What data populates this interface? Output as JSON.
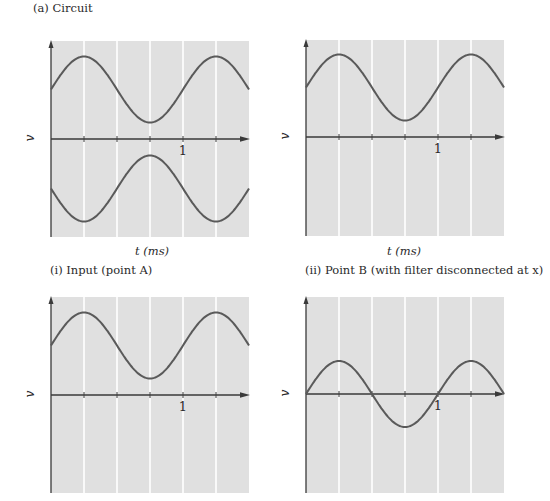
{
  "figure": {
    "title": "(a) Circuit",
    "colors": {
      "plot_bg": "#e0e0e0",
      "grid": "#ffffff",
      "axis": "#3a3a3a",
      "curve": "#5a5a5a"
    }
  },
  "panels": [
    {
      "id": "top-left",
      "caption": "",
      "xlabel": "t (ms)",
      "ylabel": "v"
    },
    {
      "id": "top-right",
      "caption": "",
      "xlabel": "t (ms)",
      "ylabel": "v"
    },
    {
      "id": "bottom-left",
      "caption": "(i) Input (point A)",
      "xlabel": "",
      "ylabel": "v"
    },
    {
      "id": "bottom-right",
      "caption": "(ii) Point B (with filter disconnected at x)",
      "xlabel": "",
      "ylabel": "v"
    }
  ],
  "chart_data": [
    {
      "type": "line",
      "title": "",
      "xlabel": "t (ms)",
      "ylabel": "v",
      "xlim": [
        0,
        1.5
      ],
      "xticks": [
        0.25,
        0.5,
        0.75,
        1.0,
        1.25
      ],
      "xtick_labels": {
        "1.0": "1"
      },
      "grid": "vertical",
      "series": [
        {
          "name": "upper (offset sinusoid)",
          "shape": "dc_offset + A*sin(2*pi*t/1ms)",
          "dc_offset": 1.5,
          "amplitude": 1.0,
          "peaks_t": [
            0.25,
            1.25
          ],
          "trough_t": 0.75
        },
        {
          "name": "lower (inverted offset sinusoid)",
          "shape": "-(dc_offset + A*sin(2*pi*t/1ms))",
          "dc_offset": -1.5,
          "amplitude": 1.0,
          "troughs_t": [
            0.25,
            1.25
          ],
          "peak_t": 0.75
        }
      ]
    },
    {
      "type": "line",
      "title": "",
      "xlabel": "t (ms)",
      "ylabel": "v",
      "xlim": [
        0,
        1.5
      ],
      "xticks": [
        0.25,
        0.5,
        0.75,
        1.0,
        1.25
      ],
      "xtick_labels": {
        "1.0": "1"
      },
      "grid": "vertical",
      "series": [
        {
          "name": "offset sinusoid",
          "dc_offset": 1.5,
          "amplitude": 1.0,
          "peaks_t": [
            0.25,
            1.25
          ],
          "trough_t": 0.75
        }
      ]
    },
    {
      "type": "line",
      "title": "(i) Input (point A)",
      "xlabel": "",
      "ylabel": "v",
      "xlim": [
        0,
        1.5
      ],
      "xticks": [
        0.25,
        0.5,
        0.75,
        1.0,
        1.25
      ],
      "xtick_labels": {
        "1.0": "1"
      },
      "grid": "vertical",
      "series": [
        {
          "name": "input",
          "dc_offset": 1.5,
          "amplitude": 1.0,
          "peaks_t": [
            0.25,
            1.25
          ],
          "trough_t": 0.75
        }
      ]
    },
    {
      "type": "line",
      "title": "(ii) Point B (with filter disconnected at x)",
      "xlabel": "",
      "ylabel": "v",
      "xlim": [
        0,
        1.5
      ],
      "xticks": [
        0.25,
        0.5,
        0.75,
        1.0,
        1.25
      ],
      "xtick_labels": {
        "1.0": "1"
      },
      "grid": "vertical",
      "series": [
        {
          "name": "point B",
          "dc_offset": 0,
          "amplitude": 1.0,
          "zero_crossings_t": [
            0,
            0.5,
            1.0,
            1.5
          ],
          "peaks_t": [
            0.25,
            1.25
          ],
          "trough_t": 0.75
        }
      ]
    }
  ]
}
